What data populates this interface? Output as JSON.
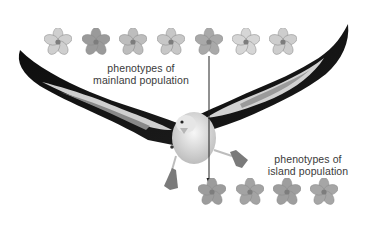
{
  "labels": {
    "mainland": {
      "line1": "phenotypes of",
      "line2": "mainland population"
    },
    "island": {
      "line1": "phenotypes of",
      "line2": "island population"
    }
  },
  "mainland_flowers": [
    {
      "x": 58,
      "y": 42,
      "shade": "#cfcfcf"
    },
    {
      "x": 96,
      "y": 42,
      "shade": "#9a9a9a"
    },
    {
      "x": 133,
      "y": 42,
      "shade": "#bdbdbd"
    },
    {
      "x": 171,
      "y": 42,
      "shade": "#c7c7c7"
    },
    {
      "x": 209,
      "y": 42,
      "shade": "#a9a9a9"
    },
    {
      "x": 246,
      "y": 42,
      "shade": "#d6d6d6"
    },
    {
      "x": 283,
      "y": 42,
      "shade": "#cdcdcd"
    }
  ],
  "island_flowers": [
    {
      "x": 212,
      "y": 192,
      "shade": "#9c9c9c"
    },
    {
      "x": 250,
      "y": 192,
      "shade": "#a3a3a3"
    },
    {
      "x": 287,
      "y": 192,
      "shade": "#9e9e9e"
    },
    {
      "x": 324,
      "y": 192,
      "shade": "#a6a6a6"
    }
  ],
  "arrow": {
    "x": 209,
    "from_y": 55,
    "to_y": 181,
    "color": "#222222"
  },
  "colors": {
    "wing_dark": "#111111",
    "wing_mid": "#6e6e6e",
    "wing_light": "#d4d4d4",
    "body": "#e8e8e8",
    "feet": "#7c7c7c"
  }
}
